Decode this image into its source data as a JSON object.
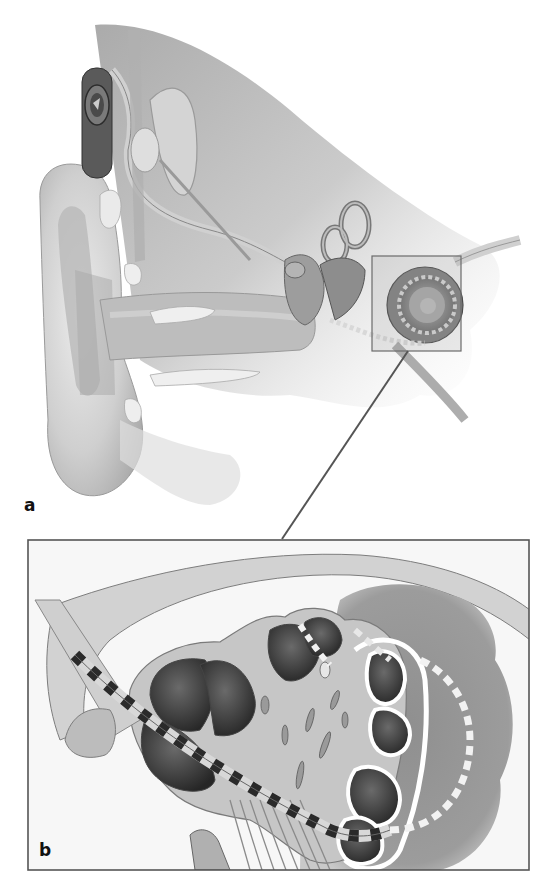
{
  "figure": {
    "style": "grayscale anatomical drawing",
    "panels": [
      {
        "id": "a",
        "label": "a",
        "content": "Cross-section of the ear showing external ear, ear canal, middle ear ossicles, semicircular canals, cochlea with inserted electrode array, and receiver/stimulator behind the ear",
        "zoom_box": {
          "x": 372,
          "y": 256,
          "w": 89,
          "h": 95
        }
      },
      {
        "id": "b",
        "label": "b",
        "content": "Magnified cross-section of cochlea turns with electrode array (banded contacts) inserted into the scala tympani and auditory nerve fibers",
        "frame": {
          "x": 28,
          "y": 540,
          "w": 501,
          "h": 330
        }
      }
    ],
    "connector": {
      "from": [
        408,
        351
      ],
      "to": [
        282,
        539
      ]
    }
  },
  "colors": {
    "background": "#ffffff",
    "frame": "#555555",
    "skin_light": "#e4e4e4",
    "skin_mid": "#c8c8c8",
    "tissue_dark": "#8a8a8a",
    "cavity_dark": "#3c3c3c",
    "electrode_band_dark": "#2a2a2a",
    "electrode_band_light": "#d8d8d8"
  }
}
